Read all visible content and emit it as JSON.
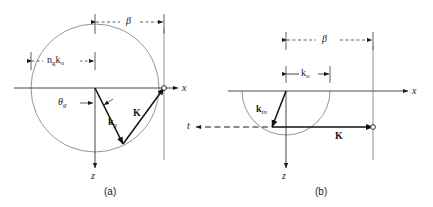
{
  "figure": {
    "width": 433,
    "height": 207,
    "background": "#ffffff",
    "stroke_color": "#1a1a1a",
    "thin_stroke_color": "#555555"
  },
  "panels": [
    {
      "id": "a",
      "caption": "(a)",
      "axis_x_label": "x",
      "axis_z_label": "z",
      "dimension_beta": {
        "label": "β",
        "style": "dashed",
        "from_x": 95,
        "to_x": 164,
        "y": 22
      },
      "dimension_ngko": {
        "label_base1": "n",
        "label_sub1": "g",
        "label_base2": "k",
        "label_sub2": "o",
        "style": "dashed",
        "from_x": 30,
        "to_x": 95,
        "y": 60
      },
      "angle_label": {
        "base": "θ",
        "sub": "g"
      },
      "vectors": [
        {
          "name": "k_g",
          "label_base": "k",
          "label_sub": "g",
          "bold": true,
          "from": [
            95,
            88
          ],
          "to": [
            123,
            144
          ]
        },
        {
          "name": "K",
          "label_base": "K",
          "bold": true,
          "from": [
            123,
            144
          ],
          "to": [
            164,
            88
          ]
        }
      ],
      "circle": {
        "cx": 95,
        "cy": 88,
        "r": 64
      },
      "endpoint_marker": {
        "cx": 164,
        "cy": 88,
        "r": 2.4
      }
    },
    {
      "id": "b",
      "caption": "(b)",
      "axis_x_label": "x",
      "axis_z_label": "z",
      "thickness_label": "t",
      "dimension_beta": {
        "label": "β",
        "style": "dashed",
        "from_x": 286,
        "to_x": 373,
        "y": 40
      },
      "dimension_ko": {
        "label_base": "k",
        "label_sub": "o",
        "style": "solid",
        "from_x": 286,
        "to_x": 330,
        "y": 74
      },
      "vectors": [
        {
          "name": "k_in",
          "label_base": "k",
          "label_sub": "in",
          "bold": true,
          "from": [
            286,
            91
          ],
          "to": [
            272,
            127
          ]
        },
        {
          "name": "K",
          "label_base": "K",
          "bold": true,
          "from": [
            272,
            127
          ],
          "to": [
            373,
            127
          ]
        }
      ],
      "semicircle": {
        "cx": 286,
        "cy": 91,
        "r": 44
      },
      "endpoint_marker": {
        "cx": 373,
        "cy": 127,
        "r": 2.4
      }
    }
  ]
}
